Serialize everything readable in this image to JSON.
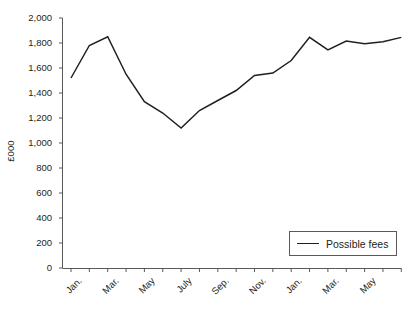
{
  "chart_data": {
    "type": "line",
    "title": "",
    "xlabel": "",
    "ylabel": "£000",
    "ylim": [
      0,
      2000
    ],
    "ytick_step": 200,
    "yticks": [
      "2,000",
      "1,800",
      "1,600",
      "1,400",
      "1,200",
      "1,000",
      "800",
      "600",
      "400",
      "200",
      "0"
    ],
    "ytick_values": [
      2000,
      1800,
      1600,
      1400,
      1200,
      1000,
      800,
      600,
      400,
      200,
      0
    ],
    "grid": false,
    "legend_position": "bottom-right",
    "categories": [
      "Jan.",
      "Feb.",
      "Mar.",
      "Apr.",
      "May",
      "June",
      "July",
      "Aug.",
      "Sep.",
      "Oct.",
      "Nov.",
      "Dec.",
      "Jan.",
      "Feb.",
      "Mar.",
      "Apr.",
      "May",
      "June",
      "July"
    ],
    "xtick_labels": [
      "Jan.",
      "Mar.",
      "May",
      "July",
      "Sep.",
      "Nov.",
      "Jan.",
      "Mar.",
      "May"
    ],
    "xtick_label_indices": [
      0,
      2,
      4,
      6,
      8,
      10,
      12,
      14,
      16
    ],
    "series": [
      {
        "name": "Possible fees",
        "color": "#231f20",
        "values": [
          1520,
          1780,
          1850,
          1550,
          1330,
          1240,
          1120,
          1260,
          1340,
          1420,
          1540,
          1560,
          1660,
          1845,
          1745,
          1815,
          1795,
          1810,
          1845
        ]
      }
    ]
  },
  "legend": {
    "label": "Possible fees"
  },
  "axis": {
    "y_title": "£000"
  }
}
